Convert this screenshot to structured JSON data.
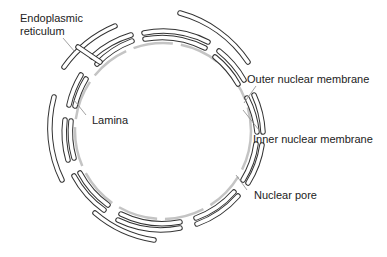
{
  "diagram": {
    "labels": {
      "er": "Endoplasmic\nreticulum",
      "er_line1": "Endoplasmic",
      "er_line2": "reticulum",
      "lamina": "Lamina",
      "outer": "Outer nuclear membrane",
      "inner": "Inner nuclear membrane",
      "pore": "Nuclear pore"
    },
    "colors": {
      "membrane_stroke": "#333333",
      "membrane_fill": "#ffffff",
      "lamina": "#bdbdbd",
      "leader": "#888888",
      "text": "#222222"
    }
  }
}
